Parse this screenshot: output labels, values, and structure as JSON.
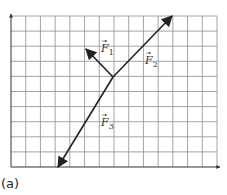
{
  "caption": "(a)",
  "top_text_cut": "(a) grid vector",
  "grid": {
    "left": 11,
    "top": 16,
    "right": 217,
    "bottom": 167,
    "cols": 14,
    "rows": 10,
    "line_color": "#9a9a9a",
    "axis_color": "#333333"
  },
  "vectors": {
    "origin": [
      113,
      77
    ],
    "color": "#222222",
    "items": [
      {
        "name": "F1",
        "label": "F",
        "sub": "1",
        "tip": [
          86,
          49
        ],
        "label_pos": [
          101,
          52
        ]
      },
      {
        "name": "F2",
        "label": "F",
        "sub": "2",
        "tip": [
          172,
          16
        ],
        "label_pos": [
          145,
          64
        ]
      },
      {
        "name": "F3",
        "label": "F",
        "sub": "3",
        "tip": [
          58,
          167
        ],
        "label_pos": [
          101,
          126
        ]
      }
    ]
  }
}
